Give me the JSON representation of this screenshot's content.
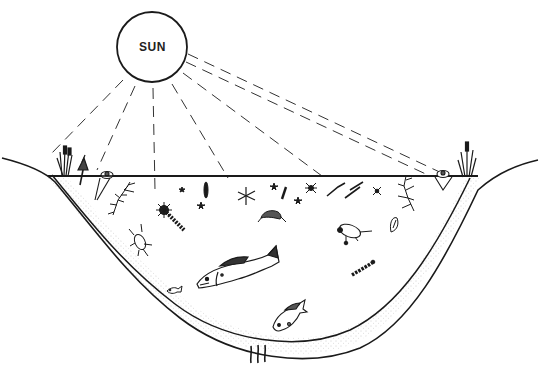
{
  "diagram": {
    "title": "",
    "type": "pond ecosystem illustration",
    "labels": {
      "sun": "SUN"
    },
    "elements": [
      "sun",
      "sun-rays",
      "water-surface",
      "pond-basin",
      "bottom-sediment",
      "emergent-plants-left",
      "emergent-plants-right",
      "floating-plants",
      "submerged-plants",
      "plankton",
      "insects",
      "crustacean",
      "large-fish",
      "small-fish",
      "sunfish",
      "snail",
      "larva",
      "bottom-worms"
    ],
    "colors": {
      "ink": "#1a1a1a",
      "background": "#ffffff",
      "sediment-stipple": "#9a9a9a"
    }
  }
}
